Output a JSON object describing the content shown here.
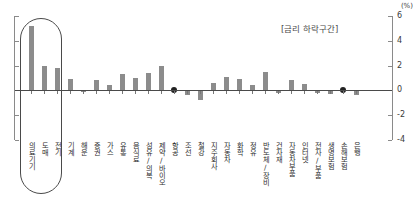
{
  "meta": {
    "unit_label": "(%)",
    "annotation": "[금리 하락구간]",
    "ghost_title": ""
  },
  "chart_data": {
    "type": "bar",
    "title": "",
    "subtitle": "[금리 하락구간]",
    "xlabel": "",
    "ylabel": "(%)",
    "ylim": [
      -4,
      6
    ],
    "yticks": [
      6,
      4,
      2,
      0,
      -2,
      -4
    ],
    "ytick_labels": [
      "6",
      "4",
      "2",
      "0",
      "-2",
      "-4"
    ],
    "grid": false,
    "legend": false,
    "bar_color": "#8c8c8c",
    "marker_color": "#222222",
    "categories": [
      "의료기기",
      "도매",
      "전기",
      "기계",
      "해운",
      "증권",
      "가스",
      "유통",
      "음식료",
      "섬유/의복",
      "제약/바이오",
      "항공",
      "조선",
      "철강",
      "지주회사",
      "자동차",
      "화학",
      "정유",
      "반도체/장비",
      "건자재",
      "자동차부품",
      "인터넷",
      "전자/부품",
      "생명보험",
      "손해보험",
      "은행"
    ],
    "values": [
      5.2,
      2.0,
      1.8,
      0.9,
      -0.1,
      0.8,
      0.45,
      1.3,
      1.0,
      1.4,
      2.0,
      0.0,
      -0.4,
      -0.8,
      0.6,
      1.1,
      0.9,
      0.4,
      1.5,
      -0.2,
      0.85,
      0.5,
      -0.25,
      -0.3,
      0.0,
      -0.35
    ],
    "marker_indices": [
      11,
      24
    ],
    "highlight": {
      "label": "의료기기·도매·전기",
      "category_indices": [
        0,
        1,
        2
      ],
      "shape": "rounded-rectangle"
    }
  }
}
